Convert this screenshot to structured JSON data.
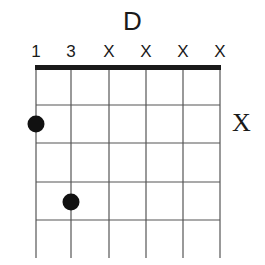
{
  "chord": {
    "name": "D",
    "string_labels": [
      "1",
      "3",
      "X",
      "X",
      "X",
      "X"
    ],
    "side_marker": "X",
    "strings": 6,
    "frets_shown": 5,
    "dots": [
      {
        "string": 1,
        "fret": 2
      },
      {
        "string": 2,
        "fret": 4
      }
    ],
    "colors": {
      "ink": "#1a1a1a",
      "grid": "#555555",
      "background": "#ffffff"
    }
  }
}
